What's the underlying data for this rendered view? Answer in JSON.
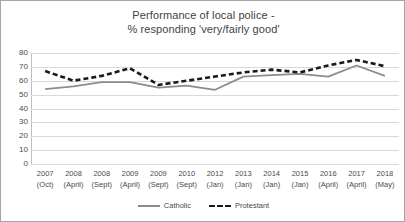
{
  "chart_data": {
    "type": "line",
    "title": "Performance of local police - % responding 'very/fairly good'",
    "title_lines": [
      "Performance of local police -",
      "% responding 'very/fairly good'"
    ],
    "xlabel": "",
    "ylabel": "",
    "ylim": [
      0,
      80
    ],
    "ytick_step": 10,
    "yticks": [
      80,
      70,
      60,
      50,
      40,
      30,
      20,
      10,
      0
    ],
    "grid": true,
    "legend_position": "bottom",
    "categories": [
      "2007 (Oct)",
      "2008 (April)",
      "2008 (Sept)",
      "2009 (April)",
      "2009 (Sept)",
      "2010 (Sept)",
      "2012 (Jan)",
      "2013 (Jan)",
      "2014 (Jan)",
      "2015 (Jan)",
      "2016 (April)",
      "2017 (April)",
      "2018 (May)"
    ],
    "category_parts": [
      {
        "year": "2007",
        "month": "(Oct)"
      },
      {
        "year": "2008",
        "month": "(April)"
      },
      {
        "year": "2008",
        "month": "(Sept)"
      },
      {
        "year": "2009",
        "month": "(April)"
      },
      {
        "year": "2009",
        "month": "(Sept)"
      },
      {
        "year": "2010",
        "month": "(Sept)"
      },
      {
        "year": "2012",
        "month": "(Jan)"
      },
      {
        "year": "2013",
        "month": "(Jan)"
      },
      {
        "year": "2014",
        "month": "(Jan)"
      },
      {
        "year": "2015",
        "month": "(Jan)"
      },
      {
        "year": "2016",
        "month": "(April)"
      },
      {
        "year": "2017",
        "month": "(April)"
      },
      {
        "year": "2018",
        "month": "(May)"
      }
    ],
    "series": [
      {
        "name": "Catholic",
        "style": "solid",
        "color": "#8c8c8c",
        "values": [
          54,
          56,
          59,
          59,
          55,
          56.5,
          53.5,
          63,
          64,
          65,
          63,
          71,
          63.5
        ]
      },
      {
        "name": "Protestant",
        "style": "dashed",
        "color": "#1a1a1a",
        "values": [
          67,
          60,
          63.5,
          69,
          57,
          60,
          63,
          66,
          68,
          66,
          71,
          75,
          70.5
        ]
      }
    ]
  },
  "legend": {
    "entries": [
      {
        "label": "Catholic"
      },
      {
        "label": "Protestant"
      }
    ]
  },
  "colors": {
    "catholic_line": "#8c8c8c",
    "protestant_line": "#1a1a1a",
    "gridline": "#d9d9d9",
    "frame_border": "#a6a6a6",
    "text": "#4a4a4a",
    "title_text": "#3f3f3f"
  }
}
